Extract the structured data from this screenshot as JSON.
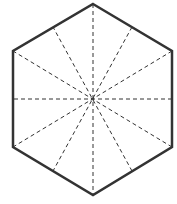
{
  "diagram": {
    "shape": "regular-hexagon",
    "center": [
      93,
      99
    ],
    "vertices": [
      [
        93,
        4
      ],
      [
        172,
        51
      ],
      [
        172,
        147
      ],
      [
        93,
        195
      ],
      [
        13,
        147
      ],
      [
        13,
        51
      ]
    ],
    "outline": {
      "color": "#333333",
      "width": 2.5
    },
    "symmetry_lines": {
      "count": 6,
      "style": "dashed",
      "color": "#333333",
      "width": 1,
      "dash": "4,3",
      "vertex_to_vertex": [
        [
          [
            93,
            4
          ],
          [
            93,
            195
          ]
        ],
        [
          [
            172,
            51
          ],
          [
            13,
            147
          ]
        ],
        [
          [
            172,
            147
          ],
          [
            13,
            51
          ]
        ]
      ],
      "midpoint_to_midpoint": [
        [
          [
            132,
            27
          ],
          [
            53,
            171
          ]
        ],
        [
          [
            172,
            99
          ],
          [
            13,
            99
          ]
        ],
        [
          [
            132,
            171
          ],
          [
            53,
            27
          ]
        ]
      ]
    }
  }
}
